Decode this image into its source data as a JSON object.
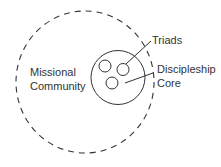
{
  "diagram": {
    "type": "nested-circles",
    "outer_circle": {
      "label_line1": "Missional",
      "label_line2": "Community",
      "style": "dashed"
    },
    "inner_circle": {
      "label_line1": "Discipleship",
      "label_line2": "Core",
      "style": "solid"
    },
    "small_circles": {
      "label": "Triads",
      "count": 3,
      "style": "solid"
    },
    "colors": {
      "stroke": "#333333",
      "text": "#333333",
      "background": "#ffffff"
    }
  }
}
